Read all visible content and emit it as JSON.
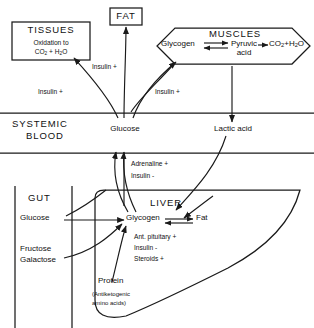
{
  "figure": {
    "stroke_color": "#1a1a1a",
    "background": "#ffffff"
  },
  "compartments": {
    "tissues": {
      "name": "TISSUES",
      "line1": "Oxidation to",
      "line2_pre": "CO",
      "line2_sub1": "2",
      "line2_mid": " + H",
      "line2_sub2": "2",
      "line2_post": "O"
    },
    "fat": {
      "name": "FAT"
    },
    "muscles": {
      "name": "MUSCLES",
      "glycogen": "Glycogen",
      "pyruvic_line1": "Pyruvic",
      "pyruvic_line2": "acid",
      "end_pre": "CO",
      "end_sub1": "2",
      "end_mid": "+H",
      "end_sub2": "2",
      "end_post": "O"
    },
    "systemic_blood": {
      "name_line1": "SYSTEMIC",
      "name_line2": "BLOOD",
      "glucose": "Glucose",
      "lactic_acid": "Lactic acid"
    },
    "gut": {
      "name": "GUT",
      "glucose": "Glucose",
      "fructose": "Fructose",
      "galactose": "Galactose"
    },
    "liver": {
      "name": "LIVER",
      "glycogen": "Glycogen",
      "fat": "Fat",
      "protein": "Protein",
      "protein_note_line1": "(Antiketogenic",
      "protein_note_line2": "amino acids)"
    }
  },
  "annotations": {
    "insulin_tissues": "Insulin +",
    "insulin_fat": "Insulin +",
    "insulin_muscles": "Insulin +",
    "adrenaline_plus": "Adrenaline +",
    "insulin_minus": "Insulin -",
    "ant_pituitary_plus": "Ant. pituitary +",
    "liver_insulin_minus": "Insulin -",
    "steroids_plus": "Steroids +"
  }
}
